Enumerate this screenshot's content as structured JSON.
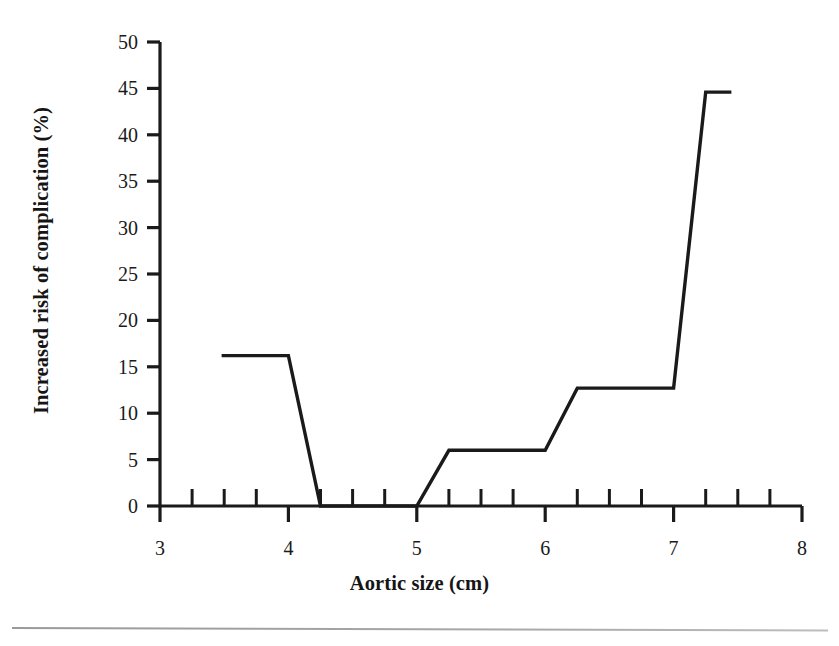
{
  "figure": {
    "name": "aortic-size-risk-chart",
    "background_color": "#ffffff",
    "line_color": "#1a1a1a",
    "axis_color": "#1a1a1a"
  },
  "chart_data": {
    "type": "line",
    "title": "",
    "xlabel": "Aortic size (cm)",
    "ylabel": "Increased risk of complication (%)",
    "xlim": [
      3,
      8
    ],
    "ylim": [
      0,
      50
    ],
    "grid": false,
    "legend": null,
    "x_ticks": [
      3,
      4,
      5,
      6,
      7,
      8
    ],
    "x_tick_labels": [
      "3",
      "4",
      "5",
      "6",
      "7",
      "8"
    ],
    "x_minor_tick_step": 0.25,
    "y_ticks": [
      0,
      5,
      10,
      15,
      20,
      25,
      30,
      35,
      40,
      45,
      50
    ],
    "y_tick_labels": [
      "0",
      "5",
      "10",
      "15",
      "20",
      "25",
      "30",
      "35",
      "40",
      "45",
      "50"
    ],
    "series": [
      {
        "name": "Increased risk of complication",
        "x": [
          3.48,
          4.0,
          4.25,
          5.0,
          5.25,
          6.0,
          6.25,
          7.0,
          7.25,
          7.45
        ],
        "y": [
          16.2,
          16.2,
          0.0,
          0.0,
          6.0,
          6.0,
          12.7,
          12.7,
          44.6,
          44.6
        ]
      }
    ],
    "annotations": []
  },
  "axis_label_fontsize_px": 20.5,
  "tick_label_fontsize_px": 20
}
